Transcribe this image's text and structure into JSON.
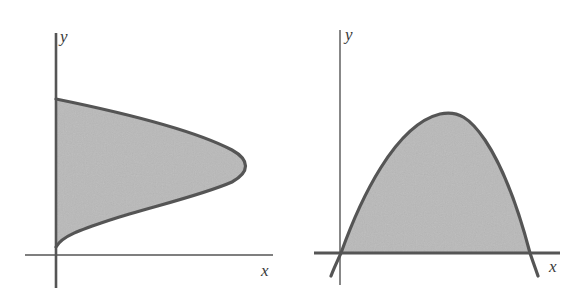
{
  "panels": [
    {
      "id": "left",
      "description": "Region bounded by a sideways (right-opening-leftward) curve and the y-axis",
      "axes": {
        "x_label": "x",
        "y_label": "y"
      },
      "colors": {
        "fill": "#b9b9b9",
        "curve": "#555555",
        "axis": "#555555"
      }
    },
    {
      "id": "right",
      "description": "Region under a downward-opening curve above the x-axis",
      "axes": {
        "x_label": "x",
        "y_label": "y"
      },
      "colors": {
        "fill": "#b9b9b9",
        "curve": "#555555",
        "axis": "#555555"
      }
    }
  ]
}
